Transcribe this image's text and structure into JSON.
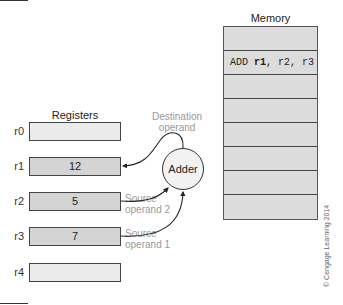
{
  "memory": {
    "title": "Memory",
    "rows": [
      {
        "text": ""
      },
      {
        "prefix": "ADD ",
        "bold": "r1",
        "suffix": ", r2, r3"
      },
      {
        "text": ""
      },
      {
        "text": ""
      },
      {
        "text": ""
      },
      {
        "text": ""
      },
      {
        "text": ""
      },
      {
        "text": ""
      }
    ]
  },
  "registers": {
    "title": "Registers",
    "items": [
      {
        "name": "r0",
        "value": ""
      },
      {
        "name": "r1",
        "value": "12"
      },
      {
        "name": "r2",
        "value": "5"
      },
      {
        "name": "r3",
        "value": "7"
      },
      {
        "name": "r4",
        "value": ""
      }
    ]
  },
  "adder": {
    "label": "Adder"
  },
  "labels": {
    "destination_line1": "Destination",
    "destination_line2": "operand",
    "source2_line1": "Source",
    "source2_line2": "operand 2",
    "source1_line1": "Source",
    "source1_line2": "operand 1"
  },
  "copyright": "© Cengage Learning 2014",
  "colors": {
    "register_filled": "#d4d4d4",
    "register_empty": "#ebebeb",
    "memory_bg": "#dcdcdc",
    "annotation": "#999999"
  }
}
